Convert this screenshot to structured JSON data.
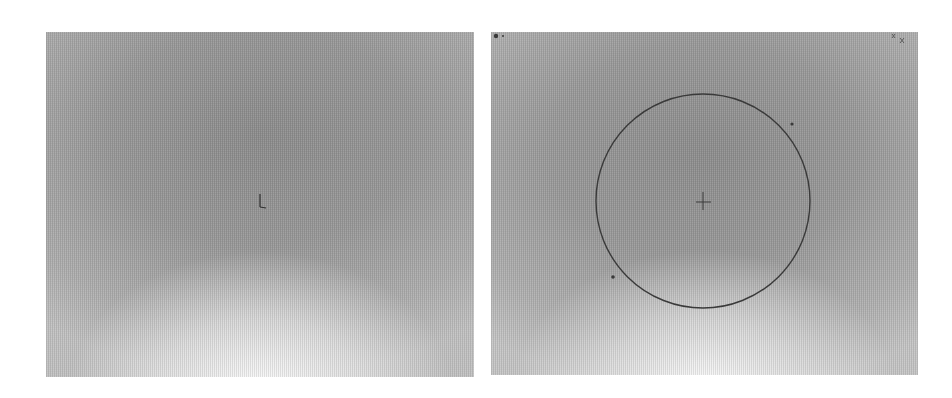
{
  "panels": [
    {
      "id": "left",
      "description": "grayscale gradient image with center cross marker",
      "marker": {
        "type": "cross",
        "x": 214,
        "y": 170
      }
    },
    {
      "id": "right",
      "description": "grayscale gradient image with circle overlay and center cross marker",
      "marker": {
        "type": "cross",
        "x": 212,
        "y": 169
      },
      "circle": {
        "cx": 212,
        "cy": 169,
        "r": 107,
        "stroke": "#3a3a3a"
      },
      "dots": [
        {
          "x": 301,
          "y": 92
        },
        {
          "x": 122,
          "y": 245
        }
      ],
      "corner_marks": {
        "top_left": "• ·",
        "top_right": "⁺⁄ₓ"
      }
    }
  ],
  "colors": {
    "background": "#ffffff",
    "panel_dark": "#8e8e8e",
    "panel_light": "#f5f5f5",
    "stroke": "#3a3a3a"
  }
}
